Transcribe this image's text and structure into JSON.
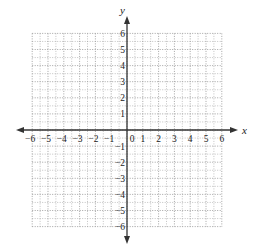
{
  "diagram": {
    "type": "coordinate-grid",
    "x_axis": {
      "label": "x",
      "min": -6,
      "max": 6,
      "ticks": [
        "-6",
        "-5",
        "-4",
        "-3",
        "-2",
        "-1",
        "0",
        "1",
        "2",
        "3",
        "4",
        "5",
        "6"
      ]
    },
    "y_axis": {
      "label": "y",
      "min": -6,
      "max": 6,
      "ticks": [
        "6",
        "5",
        "4",
        "3",
        "2",
        "1",
        "-1",
        "-2",
        "-3",
        "-4",
        "-5",
        "-6"
      ]
    },
    "grid": {
      "major_step": 1,
      "minor_step": 0.5,
      "style": "dotted"
    },
    "colors": {
      "axis": "#333333",
      "grid": "#9a9a9a",
      "background": "#ffffff"
    }
  }
}
